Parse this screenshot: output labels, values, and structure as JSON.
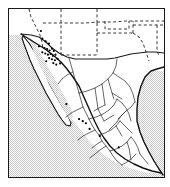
{
  "figure": {
    "kind": "distribution-map",
    "title": "Distribution map of Mexico and the southwestern United States",
    "caption": "",
    "background_color": "#ffffff",
    "frame_color": "#1a1a1a",
    "ocean_fill_color": "#d8d8d8",
    "land_fill_color": "#ffffff",
    "coastline_color": "#111111",
    "state_border_color": "#333333",
    "dashed_border_color": "#222222",
    "point_color": "#000000"
  },
  "legend": {
    "visible": false,
    "entries": []
  },
  "regions": [
    {
      "name": "Pacific Ocean",
      "label": "",
      "fill": "ocean"
    },
    {
      "name": "Gulf of California",
      "label": "",
      "fill": "ocean"
    },
    {
      "name": "Gulf of Mexico",
      "label": "",
      "fill": "ocean"
    },
    {
      "name": "Mexico",
      "label": "",
      "fill": "land"
    },
    {
      "name": "United States Southwest",
      "label": "",
      "fill": "land"
    },
    {
      "name": "Baja California Peninsula",
      "label": "",
      "fill": "land"
    }
  ],
  "map_data": {
    "type": "point-occurrence",
    "point_count": 31,
    "point_radius_px": 1.1,
    "points": [
      {
        "x": 0.215,
        "y": 0.176
      },
      {
        "x": 0.236,
        "y": 0.193
      },
      {
        "x": 0.258,
        "y": 0.206
      },
      {
        "x": 0.193,
        "y": 0.222
      },
      {
        "x": 0.229,
        "y": 0.232
      },
      {
        "x": 0.246,
        "y": 0.238
      },
      {
        "x": 0.262,
        "y": 0.247
      },
      {
        "x": 0.278,
        "y": 0.236
      },
      {
        "x": 0.289,
        "y": 0.25
      },
      {
        "x": 0.215,
        "y": 0.258
      },
      {
        "x": 0.234,
        "y": 0.265
      },
      {
        "x": 0.251,
        "y": 0.272
      },
      {
        "x": 0.268,
        "y": 0.268
      },
      {
        "x": 0.283,
        "y": 0.279
      },
      {
        "x": 0.3,
        "y": 0.272
      },
      {
        "x": 0.259,
        "y": 0.292
      },
      {
        "x": 0.277,
        "y": 0.299
      },
      {
        "x": 0.296,
        "y": 0.305
      },
      {
        "x": 0.313,
        "y": 0.296
      },
      {
        "x": 0.24,
        "y": 0.311
      },
      {
        "x": 0.286,
        "y": 0.322
      },
      {
        "x": 0.305,
        "y": 0.331
      },
      {
        "x": 0.33,
        "y": 0.324
      },
      {
        "x": 0.206,
        "y": 0.131
      },
      {
        "x": 0.37,
        "y": 0.566
      },
      {
        "x": 0.452,
        "y": 0.655
      },
      {
        "x": 0.476,
        "y": 0.668
      },
      {
        "x": 0.496,
        "y": 0.68
      },
      {
        "x": 0.52,
        "y": 0.714
      },
      {
        "x": 0.586,
        "y": 0.756
      },
      {
        "x": 0.708,
        "y": 0.824
      }
    ]
  }
}
